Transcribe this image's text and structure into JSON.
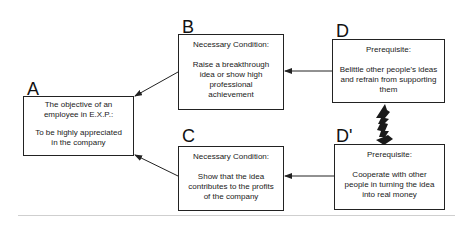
{
  "diagram": {
    "type": "evaporating-cloud",
    "nodes": {
      "A": {
        "letter": "A",
        "head": "The  objective of an employee in E.X.P.:",
        "body": "To be highly appreciated in the company"
      },
      "B": {
        "letter": "B",
        "head": "Necessary Condition:",
        "body": "Raise a breakthrough idea or show high professional achievement"
      },
      "C": {
        "letter": "C",
        "head": "Necessary Condition:",
        "body": "Show that the idea contributes to the profits of the company"
      },
      "D": {
        "letter": "D",
        "head": "Prerequisite:",
        "body": "Belittle other people's ideas and refrain from supporting them"
      },
      "Dp": {
        "letter": "D'",
        "head": "Prerequisite:",
        "body": "Cooperate with other people in turning the idea into real money"
      }
    },
    "edges": [
      {
        "from": "B",
        "to": "A",
        "kind": "arrow"
      },
      {
        "from": "C",
        "to": "A",
        "kind": "arrow"
      },
      {
        "from": "D",
        "to": "B",
        "kind": "arrow"
      },
      {
        "from": "Dp",
        "to": "C",
        "kind": "arrow"
      },
      {
        "from": "D",
        "to": "Dp",
        "kind": "conflict-lightning"
      }
    ],
    "colors": {
      "line": "#222222",
      "text": "#1a1a1a",
      "baseline": "#cfcfcf"
    }
  }
}
